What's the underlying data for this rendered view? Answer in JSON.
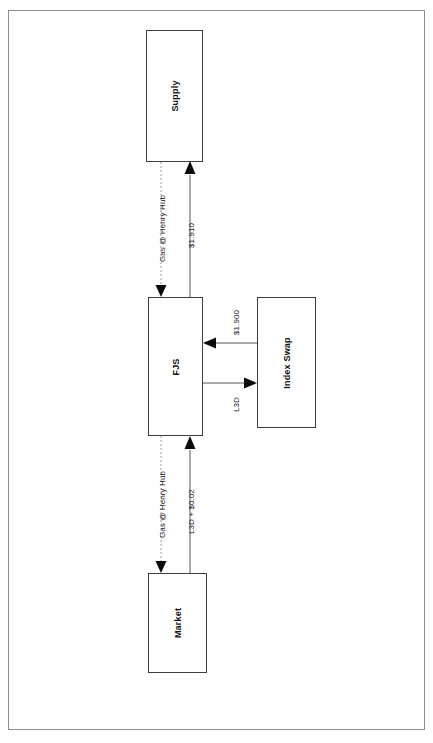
{
  "diagram": {
    "nodes": [
      {
        "id": "supply",
        "label": "Supply"
      },
      {
        "id": "fjs",
        "label": "FJS"
      },
      {
        "id": "index_swap",
        "label": "Index Swap"
      },
      {
        "id": "market",
        "label": "Market"
      }
    ],
    "edges": [
      {
        "id": "supply-to-fjs",
        "label": "Gas @ Henry Hub",
        "from": "supply",
        "to": "fjs",
        "style": "dashed",
        "direction": "down"
      },
      {
        "id": "fjs-to-supply",
        "label": "$1.910",
        "from": "fjs",
        "to": "supply",
        "style": "solid",
        "direction": "up"
      },
      {
        "id": "indexswap-to-fjs",
        "label": "$1.900",
        "from": "index_swap",
        "to": "fjs",
        "style": "solid",
        "direction": "left"
      },
      {
        "id": "fjs-to-indexswap",
        "label": "L3D",
        "from": "fjs",
        "to": "index_swap",
        "style": "solid",
        "direction": "right"
      },
      {
        "id": "fjs-to-market",
        "label": "Gas @ Henry Hub",
        "from": "fjs",
        "to": "market",
        "style": "dashed",
        "direction": "down"
      },
      {
        "id": "market-to-fjs",
        "label": "L3D + $0.02",
        "from": "market",
        "to": "fjs",
        "style": "solid",
        "direction": "up"
      }
    ],
    "colors": {
      "frame": "#8b8b92",
      "node_border": "#3d3d40",
      "solid_line": "#55555a",
      "dashed_line": "#9a9aa0",
      "arrow_head": "#0b0b0d",
      "text": "#111114",
      "background": "#ffffff"
    }
  }
}
